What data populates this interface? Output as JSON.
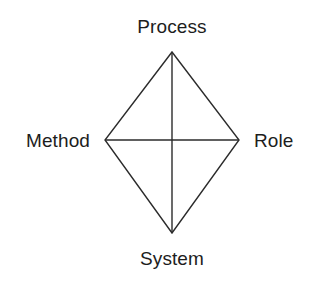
{
  "diagram": {
    "type": "rhombus-quadrant-diagram",
    "title": "",
    "background_color": "#ffffff",
    "stroke_color": "#2b2b2b",
    "stroke_width": 1.4,
    "text_color": "#1d1d1d",
    "geometry": {
      "top_vertex": {
        "x": 172,
        "y": 52
      },
      "left_vertex": {
        "x": 105,
        "y": 140
      },
      "right_vertex": {
        "x": 239,
        "y": 140
      },
      "bottom_vertex": {
        "x": 172,
        "y": 233
      },
      "center": {
        "x": 172,
        "y": 140
      }
    },
    "vertices": [
      {
        "id": "top",
        "label": "Process"
      },
      {
        "id": "left",
        "label": "Method"
      },
      {
        "id": "right",
        "label": "Role"
      },
      {
        "id": "bottom",
        "label": "System"
      }
    ],
    "edges": [
      {
        "from": "top",
        "to": "right"
      },
      {
        "from": "right",
        "to": "bottom"
      },
      {
        "from": "bottom",
        "to": "left"
      },
      {
        "from": "left",
        "to": "top"
      }
    ],
    "axes": [
      {
        "id": "vertical-axis",
        "from": "top",
        "to": "bottom"
      },
      {
        "id": "horizontal-axis",
        "from": "left",
        "to": "right"
      }
    ]
  }
}
